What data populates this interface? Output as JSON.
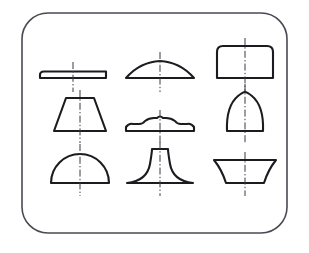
{
  "figure": {
    "background_color": "#ffffff",
    "outline_color": "#1c1c20",
    "frame_color": "#4a4a52",
    "centerline_color": "#3a3a42",
    "canvas": {
      "width": 309,
      "height": 253
    }
  },
  "frame": {
    "name": "rounded-rectangle-border",
    "x": 22,
    "y": 13,
    "width": 265,
    "height": 220,
    "corner_radius": 26,
    "stroke_width": 1.6
  },
  "grid": {
    "rows": 3,
    "columns": 3,
    "column_centers": [
      73,
      160,
      245
    ],
    "row_baselines": [
      78,
      131,
      183
    ]
  },
  "shapes": [
    {
      "index": 1,
      "row": 1,
      "column": 1,
      "name": "flat-slab-profile",
      "label": "Thin flat slab, rounded left end",
      "center_x": 73,
      "baseline_y": 78,
      "width": 66,
      "height": 7,
      "outline_path": "M 44 71.5 Q 40 71.5 40 75 L 40 78 L 106 78 L 106 71.5 Z",
      "centerline": {
        "x": 73,
        "y1": 62,
        "y2": 92
      }
    },
    {
      "index": 2,
      "row": 1,
      "column": 2,
      "name": "shallow-arc-lens-profile",
      "label": "Shallow segmental arc with flat base",
      "center_x": 160,
      "baseline_y": 78,
      "width": 68,
      "height": 14,
      "outline_path": "M 126 78 Q 140 62 160 61 Q 180 62 194 78 Z",
      "centerline": {
        "x": 160,
        "y1": 52,
        "y2": 92
      }
    },
    {
      "index": 3,
      "row": 1,
      "column": 3,
      "name": "round-top-rectangle-profile",
      "label": "Rectangle with rounded upper corners",
      "center_x": 245,
      "baseline_y": 78,
      "width": 56,
      "height": 32,
      "outline_path": "M 217 78 L 217 52 Q 217 46 223 46 L 267 46 Q 273 46 273 52 L 273 78 Z",
      "centerline": {
        "x": 245,
        "y1": 38,
        "y2": 92
      }
    },
    {
      "index": 4,
      "row": 2,
      "column": 1,
      "name": "trapezoid-profile",
      "label": "Isosceles trapezoid, wide base",
      "center_x": 80,
      "baseline_y": 131,
      "width": 52,
      "height": 33,
      "outline_path": "M 54 131 L 66 98 L 94 98 L 106 131 Z",
      "centerline": {
        "x": 80,
        "y1": 90,
        "y2": 143
      }
    },
    {
      "index": 5,
      "row": 2,
      "column": 2,
      "name": "stepped-molding-profile",
      "label": "Symmetric stepped molding with rounded lobes",
      "center_x": 160,
      "baseline_y": 131,
      "width": 68,
      "height": 12,
      "outline_path": "M 126 131 L 126 127 Q 129 123 133 124 L 139 124 Q 143 124 145 121 Q 149 118 154 118 L 157 118 Q 160 115 163 118 L 166 118 Q 171 118 175 121 Q 177 124 181 124 L 187 124 Q 191 123 194 127 L 194 131 Z",
      "centerline": {
        "x": 160,
        "y1": 110,
        "y2": 143
      }
    },
    {
      "index": 6,
      "row": 2,
      "column": 3,
      "name": "ogive-arch-profile",
      "label": "Pointed ogive / parabolic arch",
      "center_x": 245,
      "baseline_y": 131,
      "width": 36,
      "height": 38,
      "outline_path": "M 227 131 Q 226 106 238 96 Q 243 92 245 92 Q 247 92 252 96 Q 264 106 263 131 Z",
      "centerline": {
        "x": 245,
        "y1": 84,
        "y2": 143
      }
    },
    {
      "index": 7,
      "row": 3,
      "column": 1,
      "name": "semicircle-dome-profile",
      "label": "Semicircular dome on flat base",
      "center_x": 80,
      "baseline_y": 183,
      "width": 58,
      "height": 29,
      "outline_path": "M 51 183 A 29 29 0 0 1 109 183 Z",
      "centerline": {
        "x": 80,
        "y1": 144,
        "y2": 196
      }
    },
    {
      "index": 8,
      "row": 3,
      "column": 2,
      "name": "flared-pedestal-profile",
      "label": "Flared pedestal with concave cove sides",
      "center_x": 160,
      "baseline_y": 183,
      "width": 66,
      "height": 34,
      "outline_path": "M 127 183 Q 147 181 150 164 Q 152 152 152 149 L 168 149 Q 168 152 170 164 Q 173 181 193 183 Z",
      "centerline": {
        "x": 160,
        "y1": 142,
        "y2": 196
      }
    },
    {
      "index": 9,
      "row": 3,
      "column": 3,
      "name": "concave-spool-profile",
      "label": "Spool with concave flanks, flat top and base",
      "center_x": 245,
      "baseline_y": 183,
      "width": 62,
      "height": 23,
      "outline_path": "M 214 160 Q 222 170 226 183 L 264 183 Q 268 170 276 160 Z",
      "centerline": {
        "x": 245,
        "y1": 152,
        "y2": 196
      }
    }
  ]
}
